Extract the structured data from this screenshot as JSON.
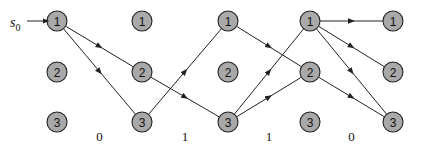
{
  "diagram": {
    "type": "trellis",
    "start_label": "s",
    "start_subscript": "0",
    "columns": [
      {
        "x": 57,
        "nodes": [
          "1",
          "2",
          "3"
        ]
      },
      {
        "x": 142,
        "nodes": [
          "1",
          "2",
          "3"
        ]
      },
      {
        "x": 228,
        "nodes": [
          "1",
          "2",
          "3"
        ]
      },
      {
        "x": 310,
        "nodes": [
          "1",
          "2",
          "3"
        ]
      },
      {
        "x": 393,
        "nodes": [
          "1",
          "2",
          "3"
        ]
      }
    ],
    "row_y": [
      21,
      72,
      122
    ],
    "stage_labels": [
      "0",
      "1",
      "1",
      "0"
    ],
    "edges": [
      {
        "from": [
          0,
          0
        ],
        "to": [
          1,
          1
        ]
      },
      {
        "from": [
          0,
          0
        ],
        "to": [
          1,
          2
        ]
      },
      {
        "from": [
          1,
          1
        ],
        "to": [
          2,
          2
        ]
      },
      {
        "from": [
          1,
          2
        ],
        "to": [
          2,
          0
        ]
      },
      {
        "from": [
          2,
          0
        ],
        "to": [
          3,
          1
        ]
      },
      {
        "from": [
          2,
          2
        ],
        "to": [
          3,
          0
        ]
      },
      {
        "from": [
          2,
          2
        ],
        "to": [
          3,
          1
        ]
      },
      {
        "from": [
          3,
          0
        ],
        "to": [
          4,
          0
        ]
      },
      {
        "from": [
          3,
          0
        ],
        "to": [
          4,
          1
        ]
      },
      {
        "from": [
          3,
          0
        ],
        "to": [
          4,
          2
        ]
      },
      {
        "from": [
          3,
          1
        ],
        "to": [
          4,
          2
        ]
      }
    ],
    "colors": {
      "node_fill": "#a9a9a9",
      "stroke": "#222222"
    }
  }
}
